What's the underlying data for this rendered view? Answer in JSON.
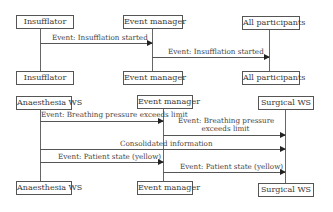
{
  "diagram_type": "sequence",
  "colors": {
    "line": "#555555",
    "text": "#3a3a3a",
    "background": "#ffffff"
  },
  "top": {
    "participants": [
      {
        "top_label": "Insufflator",
        "bottom_label": "Insufflator"
      },
      {
        "top_label": "Event manager",
        "bottom_label": "Event manager"
      },
      {
        "top_label": "All participants",
        "bottom_label": "All participants"
      }
    ],
    "messages": [
      {
        "from": "Insufflator",
        "to": "Event manager",
        "label": "Event: Insufflation started"
      },
      {
        "from": "Event manager",
        "to": "All participants",
        "label": "Event: Insufflation started"
      }
    ]
  },
  "bottom": {
    "participants": [
      {
        "top_label": "Anaesthesia WS",
        "bottom_label": "Anaesthesia WS"
      },
      {
        "top_label": "Event manager",
        "bottom_label": "Event manager"
      },
      {
        "top_label": "Surgical WS",
        "bottom_label": "Surgical WS"
      }
    ],
    "messages": [
      {
        "from": "Anaesthesia WS",
        "to": "Event manager",
        "label": "Event: Breathing pressure exceeds limit"
      },
      {
        "from": "Event manager",
        "to": "Surgical WS",
        "label_line1": "Event: Breathing pressure",
        "label_line2": "exceeds limit"
      },
      {
        "from": "Anaesthesia WS",
        "to": "Surgical WS",
        "label": "Consolidated information"
      },
      {
        "from": "Anaesthesia WS",
        "to": "Event manager",
        "label": "Event: Patient state (yellow)"
      },
      {
        "from": "Event manager",
        "to": "Surgical WS",
        "label": "Event: Patient state (yellow)"
      }
    ]
  }
}
